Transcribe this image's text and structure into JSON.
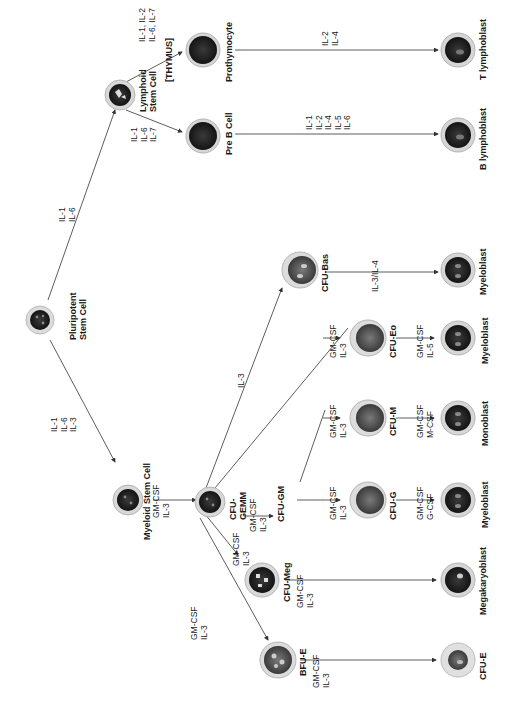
{
  "diagram": {
    "orientation": "rotated -90deg (reads bottom-to-top)",
    "colors": {
      "line": "#333333",
      "cell_outer": "#d9d9d9",
      "cell_ring": "#b5b5b5",
      "nucleus": "#1e1e1e",
      "nucleus_light": "#6a6a6a"
    },
    "nodes": {
      "pluripotent": {
        "label_lines": [
          "Pluripotent",
          "Stem Cell"
        ]
      },
      "lymphoid": {
        "label_lines": [
          "Lymphoid",
          "Stem Cell"
        ]
      },
      "thymus": {
        "label": "[THYMUS]"
      },
      "prothymocyte": {
        "label": "Prothymocyte"
      },
      "pre_b": {
        "label": "Pre B Cell"
      },
      "t_lymphoblast": {
        "label": "T lymphoblast"
      },
      "b_lymphoblast": {
        "label": "B lymphoblast"
      },
      "myeloid": {
        "label": "Myeloid Stem Cell"
      },
      "cfu_gemm": {
        "label_lines": [
          "CFU-",
          "GEMM"
        ]
      },
      "cfu_bas": {
        "label": "CFU-Bas"
      },
      "myeloblast_bas": {
        "label": "Myeloblast"
      },
      "cfu_gm": {
        "label": "CFU-GM"
      },
      "cfu_g": {
        "label": "CFU-G"
      },
      "cfu_m": {
        "label": "CFU-M"
      },
      "cfu_eo": {
        "label": "CFU-Eo"
      },
      "myeloblast_g": {
        "label": "Myeloblast"
      },
      "monoblast": {
        "label": "Monoblast"
      },
      "myeloblast_eo": {
        "label": "Myeloblast"
      },
      "cfu_meg": {
        "label": "CFU-Meg"
      },
      "megakaryoblast": {
        "label": "Megakaryoblast"
      },
      "bfu_e": {
        "label": "BFU-E"
      },
      "cfu_e": {
        "label": "CFU-E"
      }
    },
    "edges": {
      "pluri_to_lymphoid": [
        "IL-1",
        "IL-6"
      ],
      "pluri_to_myeloid": [
        "IL-1",
        "IL-6",
        "IL-3"
      ],
      "lymphoid_to_prothymocyte": [
        "IL-1, IL-2",
        "IL-6, IL-7"
      ],
      "lymphoid_to_preb": [
        "IL-1",
        "IL-6",
        "IL-7"
      ],
      "prothymocyte_to_tlympho": [
        "IL-2",
        "IL-4"
      ],
      "preb_to_blympho": [
        "IL-1",
        "IL-2",
        "IL-4",
        "IL-5",
        "IL-6"
      ],
      "myeloid_to_gemm": [
        "GM-CSF",
        "IL-3"
      ],
      "gemm_to_bas": [
        "IL-3"
      ],
      "bas_to_myeloblast": [
        "IL-3/IL-4"
      ],
      "gemm_to_gm": [
        "GM-CSF",
        "IL-3"
      ],
      "gm_to_g": [
        "GM-CSF",
        "IL-3"
      ],
      "gm_to_m": [
        "GM-CSF",
        "IL-3"
      ],
      "gemm_to_eo": [
        "GM-CSF",
        "IL-3"
      ],
      "g_to_myeloblast": [
        "GM-CSF",
        "G-CSF"
      ],
      "m_to_monoblast": [
        "GM-CSF",
        "M-CSF"
      ],
      "eo_to_myeloblast": [
        "GM-CSF",
        "IL-5"
      ],
      "gemm_to_meg": [
        "GM-CSF",
        "IL-3"
      ],
      "meg_to_megakaryoblast": [
        "GM-CSF",
        "IL-3"
      ],
      "gemm_to_bfue": [
        "GM-CSF",
        "IL-3"
      ],
      "bfue_to_cfue": [
        "GM-CSF",
        "IL-3"
      ]
    }
  }
}
